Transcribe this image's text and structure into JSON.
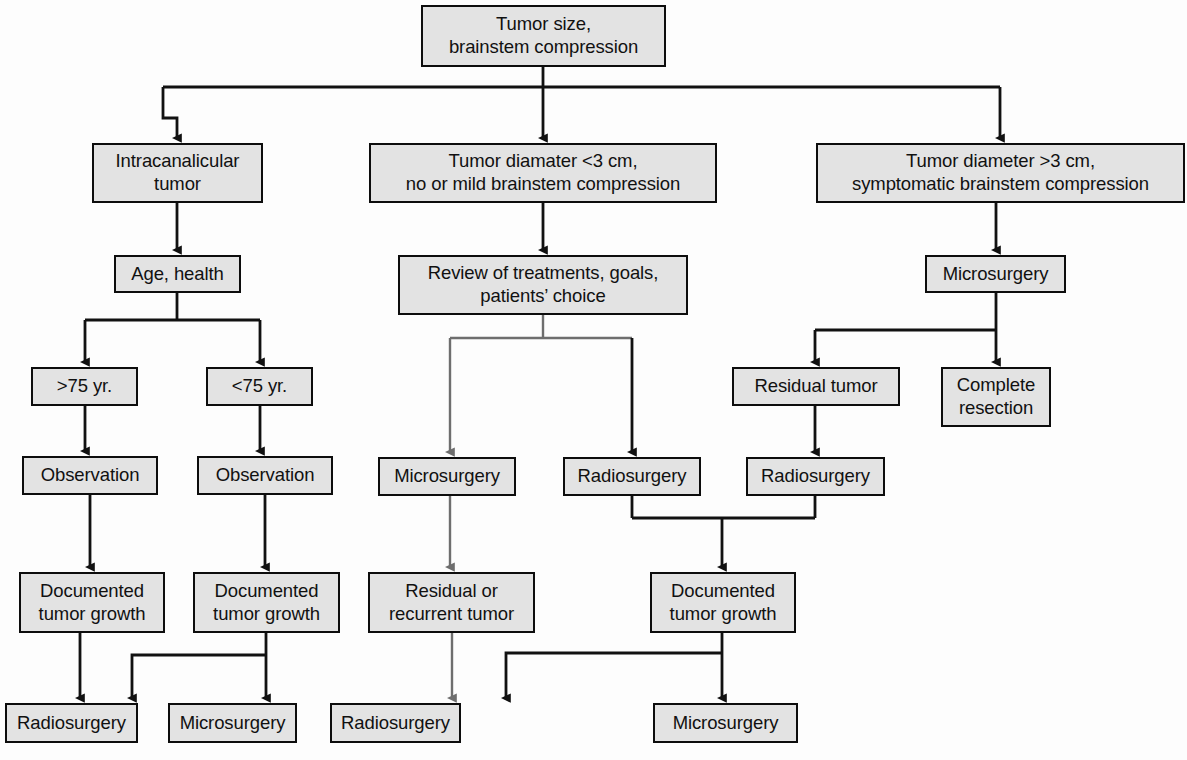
{
  "diagram": {
    "node_fill": "#e3e3e3",
    "node_stroke": "#0d0d0d",
    "edge_color": "#111111",
    "edge_color_gray": "#6e6e6e",
    "background": "#fdfdfd"
  },
  "nodes": [
    {
      "id": "root",
      "label": "Tumor size,\nbrainstem compression",
      "x": 421,
      "y": 5,
      "w": 245,
      "h": 62
    },
    {
      "id": "intracanalicular",
      "label": "Intracanalicular\ntumor",
      "x": 92,
      "y": 143,
      "w": 171,
      "h": 60
    },
    {
      "id": "small_tumor",
      "label": "Tumor diamater <3 cm,\nno or mild brainstem compression",
      "x": 369,
      "y": 143,
      "w": 348,
      "h": 60
    },
    {
      "id": "large_tumor",
      "label": "Tumor diameter >3 cm,\nsymptomatic brainstem compression",
      "x": 816,
      "y": 143,
      "w": 369,
      "h": 60
    },
    {
      "id": "age_health",
      "label": "Age, health",
      "x": 114,
      "y": 255,
      "w": 127,
      "h": 38
    },
    {
      "id": "review",
      "label": "Review of treatments, goals,\npatients’ choice",
      "x": 398,
      "y": 255,
      "w": 290,
      "h": 60
    },
    {
      "id": "micro_large",
      "label": "Microsurgery",
      "x": 925,
      "y": 255,
      "w": 141,
      "h": 38
    },
    {
      "id": "age_over75",
      "label": ">75 yr.",
      "x": 31,
      "y": 367,
      "w": 107,
      "h": 39
    },
    {
      "id": "age_under75",
      "label": "<75 yr.",
      "x": 206,
      "y": 367,
      "w": 107,
      "h": 39
    },
    {
      "id": "residual_tumor",
      "label": "Residual tumor",
      "x": 732,
      "y": 367,
      "w": 168,
      "h": 39
    },
    {
      "id": "complete_resect",
      "label": "Complete\nresection",
      "x": 941,
      "y": 367,
      "w": 110,
      "h": 60
    },
    {
      "id": "obs_left",
      "label": "Observation",
      "x": 22,
      "y": 456,
      "w": 136,
      "h": 39
    },
    {
      "id": "obs_right",
      "label": "Observation",
      "x": 197,
      "y": 456,
      "w": 136,
      "h": 39
    },
    {
      "id": "micro_review",
      "label": "Microsurgery",
      "x": 378,
      "y": 457,
      "w": 138,
      "h": 39
    },
    {
      "id": "radio_review",
      "label": "Radiosurgery",
      "x": 563,
      "y": 457,
      "w": 138,
      "h": 39
    },
    {
      "id": "radio_residual",
      "label": "Radiosurgery",
      "x": 746,
      "y": 457,
      "w": 139,
      "h": 39
    },
    {
      "id": "growth_left",
      "label": "Documented\ntumor growth",
      "x": 19,
      "y": 572,
      "w": 146,
      "h": 61
    },
    {
      "id": "growth_right",
      "label": "Documented\ntumor growth",
      "x": 193,
      "y": 572,
      "w": 147,
      "h": 61
    },
    {
      "id": "residual_recur",
      "label": "Residual or\nrecurrent tumor",
      "x": 368,
      "y": 572,
      "w": 167,
      "h": 61
    },
    {
      "id": "growth_surgical",
      "label": "Documented\ntumor growth",
      "x": 650,
      "y": 572,
      "w": 146,
      "h": 61
    },
    {
      "id": "radio_final_a",
      "label": "Radiosurgery",
      "x": 5,
      "y": 703,
      "w": 133,
      "h": 40
    },
    {
      "id": "micro_final_a",
      "label": "Microsurgery",
      "x": 168,
      "y": 703,
      "w": 129,
      "h": 40
    },
    {
      "id": "radio_final_b",
      "label": "Radiosurgery",
      "x": 330,
      "y": 703,
      "w": 131,
      "h": 40
    },
    {
      "id": "micro_final_b",
      "label": "Microsurgery",
      "x": 653,
      "y": 703,
      "w": 145,
      "h": 40
    }
  ],
  "edges": [
    {
      "name": "root-to-bus",
      "d": "M 543 67 L 543 87",
      "arrow": false,
      "color": "dark"
    },
    {
      "name": "distribution-bus",
      "d": "M 163 87 L 1000 87",
      "arrow": false,
      "color": "dark"
    },
    {
      "name": "bus-to-intracanalicular",
      "d": "M 163 87 L 163 118 L 177 118 L 177 138",
      "arrow": true,
      "color": "dark"
    },
    {
      "name": "bus-to-small-tumor",
      "d": "M 543 87 L 543 138",
      "arrow": true,
      "color": "dark"
    },
    {
      "name": "bus-to-large-tumor",
      "d": "M 1000 87 L 1000 138",
      "arrow": true,
      "color": "dark"
    },
    {
      "name": "intracanalicular-to-age",
      "d": "M 177 203 L 177 250",
      "arrow": true,
      "color": "dark"
    },
    {
      "name": "small-tumor-to-review",
      "d": "M 543 203 L 543 250",
      "arrow": true,
      "color": "dark"
    },
    {
      "name": "large-tumor-to-microsurgery",
      "d": "M 996 203 L 996 250",
      "arrow": true,
      "color": "dark"
    },
    {
      "name": "age-split-stem",
      "d": "M 177 293 L 177 320",
      "arrow": false,
      "color": "dark"
    },
    {
      "name": "age-split-bar",
      "d": "M 85 320 L 260 320",
      "arrow": false,
      "color": "dark"
    },
    {
      "name": "age-to-over75",
      "d": "M 85 320 L 85 362",
      "arrow": true,
      "color": "dark"
    },
    {
      "name": "age-to-under75",
      "d": "M 260 320 L 260 362",
      "arrow": true,
      "color": "dark"
    },
    {
      "name": "review-split-stem",
      "d": "M 543 315 L 543 338",
      "arrow": false,
      "color": "gray"
    },
    {
      "name": "review-split-bar",
      "d": "M 450 338 L 632 338",
      "arrow": false,
      "color": "gray"
    },
    {
      "name": "review-to-microsurgery",
      "d": "M 450 338 L 450 452",
      "arrow": true,
      "color": "gray"
    },
    {
      "name": "review-to-radiosurgery",
      "d": "M 632 338 L 632 452",
      "arrow": true,
      "color": "dark"
    },
    {
      "name": "micro-large-split-stem",
      "d": "M 996 293 L 996 330",
      "arrow": false,
      "color": "dark"
    },
    {
      "name": "micro-large-split-bar",
      "d": "M 815 330 L 996 330",
      "arrow": false,
      "color": "dark"
    },
    {
      "name": "micro-to-residual-tumor",
      "d": "M 815 330 L 815 362",
      "arrow": true,
      "color": "dark"
    },
    {
      "name": "micro-to-complete-resection",
      "d": "M 996 330 L 996 362",
      "arrow": true,
      "color": "dark"
    },
    {
      "name": "over75-to-observation",
      "d": "M 85 406 L 85 451",
      "arrow": true,
      "color": "dark"
    },
    {
      "name": "under75-to-observation",
      "d": "M 260 406 L 260 451",
      "arrow": true,
      "color": "dark"
    },
    {
      "name": "residual-to-radiosurgery",
      "d": "M 815 406 L 815 452",
      "arrow": true,
      "color": "dark"
    },
    {
      "name": "obs-left-to-growth",
      "d": "M 90 495 L 90 567",
      "arrow": true,
      "color": "dark"
    },
    {
      "name": "obs-right-to-growth",
      "d": "M 265 495 L 265 567",
      "arrow": true,
      "color": "dark"
    },
    {
      "name": "micro-review-to-residual",
      "d": "M 450 496 L 450 567",
      "arrow": true,
      "color": "gray"
    },
    {
      "name": "radio-merge-left",
      "d": "M 632 496 L 632 518",
      "arrow": false,
      "color": "dark"
    },
    {
      "name": "radio-merge-right",
      "d": "M 815 496 L 815 518",
      "arrow": false,
      "color": "dark"
    },
    {
      "name": "radio-merge-bar",
      "d": "M 632 518 L 815 518",
      "arrow": false,
      "color": "dark"
    },
    {
      "name": "radio-merge-to-growth",
      "d": "M 722 518 L 722 567",
      "arrow": true,
      "color": "dark"
    },
    {
      "name": "growth-left-to-radio-final",
      "d": "M 80 633 L 80 698",
      "arrow": true,
      "color": "dark"
    },
    {
      "name": "growth-right-to-micro-final",
      "d": "M 266 633 L 266 698",
      "arrow": true,
      "color": "dark"
    },
    {
      "name": "growth-right-cross-to-radio",
      "d": "M 266 655 L 132 655 L 132 698",
      "arrow": true,
      "color": "dark"
    },
    {
      "name": "residual-recur-to-radio",
      "d": "M 452 633 L 452 698",
      "arrow": true,
      "color": "gray"
    },
    {
      "name": "growth-surgical-to-micro",
      "d": "M 722 633 L 722 698",
      "arrow": true,
      "color": "dark"
    },
    {
      "name": "growth-surgical-cross-radio",
      "d": "M 722 653 L 506 653 L 506 698",
      "arrow": true,
      "color": "dark"
    }
  ]
}
